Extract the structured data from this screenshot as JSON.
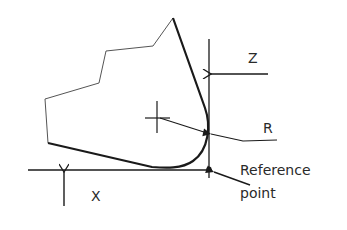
{
  "diagram": {
    "labels": {
      "z_axis": "Z",
      "x_axis": "X",
      "radius": "R",
      "reference_line1": "Reference",
      "reference_line2": "point"
    },
    "colors": {
      "line": "#1a1a1a",
      "thin_outline": "#555555",
      "text": "#2a2a2a",
      "background": "#ffffff"
    }
  }
}
